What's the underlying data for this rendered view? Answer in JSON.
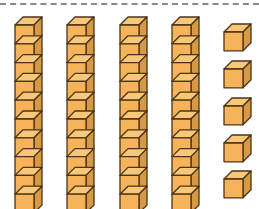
{
  "figure": {
    "title": "Base-ten blocks",
    "description": "4 tens rods and 5 unit cubes",
    "tens_rods": 4,
    "cubes_per_rod": 10,
    "unit_cubes": 5,
    "total_value": 45
  },
  "colors": {
    "front": "#f6b35a",
    "top": "#f8c878",
    "side": "#d69a45",
    "outline": "#4a3418",
    "rule": "#8a8a8a",
    "background": "#ffffff"
  }
}
